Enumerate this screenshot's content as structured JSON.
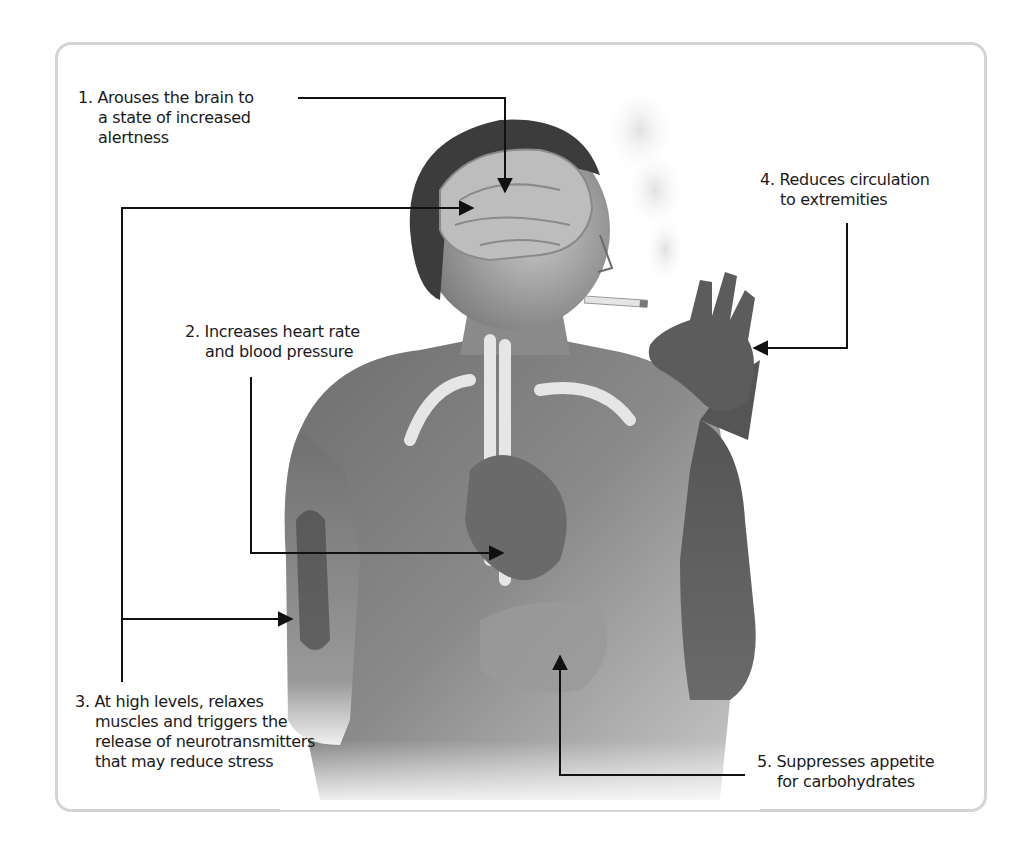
{
  "diagram": {
    "annotations": [
      {
        "number": "1.",
        "lines": [
          "Arouses the brain to",
          "a state of increased",
          "alertness"
        ],
        "target": "brain"
      },
      {
        "number": "2.",
        "lines": [
          "Increases heart rate",
          "and blood pressure"
        ],
        "target": "heart"
      },
      {
        "number": "3.",
        "lines": [
          "At high levels, relaxes",
          "muscles and triggers the",
          "release of neurotransmitters",
          "that may reduce stress"
        ],
        "target": "brain and arm muscle"
      },
      {
        "number": "4.",
        "lines": [
          "Reduces circulation",
          "to extremities"
        ],
        "target": "hand"
      },
      {
        "number": "5.",
        "lines": [
          "Suppresses appetite",
          "for carbohydrates"
        ],
        "target": "stomach"
      }
    ],
    "colors": {
      "frame": "#d4d4d4",
      "text": "#1a1a1a",
      "leader": "#111111",
      "skin_dark": "#5a5a5a",
      "skin_light": "#b5b5b5"
    }
  }
}
